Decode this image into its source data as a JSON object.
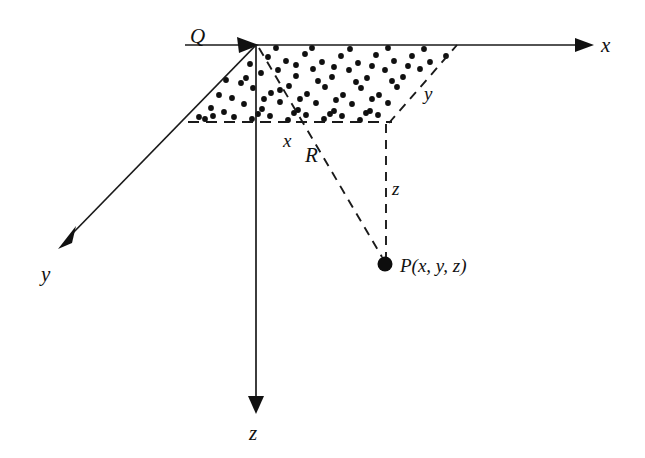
{
  "figure": {
    "background_color": "#ffffff",
    "ink_color": "#111111",
    "width": 645,
    "height": 458
  },
  "labels": {
    "origin": "Q",
    "axis_x": "x",
    "axis_y": "y",
    "axis_z": "z",
    "edge_x": "x",
    "edge_y": "y",
    "edge_z": "z",
    "radial": "R",
    "point": "P(x, y, z)"
  },
  "geometry": {
    "origin": {
      "x": 256,
      "y": 45
    },
    "point_p": {
      "x": 385,
      "y": 265
    },
    "foot_r": {
      "x": 388,
      "y": 122
    },
    "axes": [
      {
        "name": "x-axis",
        "from": [
          185,
          45
        ],
        "to": [
          590,
          45
        ],
        "arrow_at": "end"
      },
      {
        "name": "y-axis",
        "from": [
          256,
          45
        ],
        "to": [
          58,
          248
        ],
        "arrow_at": "end"
      },
      {
        "name": "z-axis",
        "from": [
          256,
          45
        ],
        "to": [
          256,
          412
        ],
        "arrow_at": "end"
      },
      {
        "name": "origin-arrow",
        "from": [
          185,
          45
        ],
        "to": [
          256,
          45
        ],
        "arrow_at": "end"
      }
    ],
    "dashed_edges": [
      {
        "name": "bottom-edge",
        "from": [
          188,
          122
        ],
        "to": [
          390,
          122
        ]
      },
      {
        "name": "right-slant-edge",
        "from": [
          388,
          122
        ],
        "to": [
          456,
          45
        ]
      },
      {
        "name": "z-drop",
        "from": [
          386,
          124
        ],
        "to": [
          386,
          258
        ]
      },
      {
        "name": "radial-R",
        "from": [
          258,
          47
        ],
        "to": [
          382,
          258
        ]
      }
    ],
    "shaded_region": {
      "name": "stippled-parallelogram",
      "vertices": [
        [
          256,
          45
        ],
        [
          456,
          45
        ],
        [
          388,
          122
        ],
        [
          188,
          122
        ]
      ]
    }
  },
  "label_positions": {
    "origin": [
      190,
      43
    ],
    "axis_x": [
      601,
      52
    ],
    "axis_y": [
      41,
      281
    ],
    "axis_z": [
      249,
      440
    ],
    "edge_x": [
      283,
      147
    ],
    "edge_y": [
      424,
      100
    ],
    "edge_z": [
      392,
      195
    ],
    "radial": [
      305,
      162
    ],
    "point": [
      400,
      272
    ]
  },
  "stipple_dots": {
    "count": 97,
    "radius": 2.9,
    "positions": [
      [
        268,
        57
      ],
      [
        286,
        61
      ],
      [
        305,
        54
      ],
      [
        322,
        62
      ],
      [
        341,
        56
      ],
      [
        358,
        63
      ],
      [
        376,
        55
      ],
      [
        394,
        61
      ],
      [
        412,
        56
      ],
      [
        430,
        62
      ],
      [
        446,
        56
      ],
      [
        261,
        73
      ],
      [
        278,
        70
      ],
      [
        296,
        76
      ],
      [
        313,
        69
      ],
      [
        332,
        77
      ],
      [
        349,
        70
      ],
      [
        367,
        78
      ],
      [
        385,
        70
      ],
      [
        403,
        77
      ],
      [
        420,
        69
      ],
      [
        437,
        76
      ],
      [
        452,
        70
      ],
      [
        253,
        88
      ],
      [
        271,
        93
      ],
      [
        289,
        86
      ],
      [
        307,
        94
      ],
      [
        325,
        87
      ],
      [
        343,
        95
      ],
      [
        361,
        88
      ],
      [
        379,
        95
      ],
      [
        397,
        87
      ],
      [
        415,
        94
      ],
      [
        432,
        87
      ],
      [
        448,
        93
      ],
      [
        244,
        104
      ],
      [
        262,
        109
      ],
      [
        280,
        102
      ],
      [
        298,
        110
      ],
      [
        316,
        103
      ],
      [
        334,
        111
      ],
      [
        352,
        104
      ],
      [
        370,
        111
      ],
      [
        388,
        103
      ],
      [
        406,
        110
      ],
      [
        423,
        104
      ],
      [
        440,
        110
      ],
      [
        234,
        117
      ],
      [
        252,
        119
      ],
      [
        270,
        116
      ],
      [
        288,
        120
      ],
      [
        306,
        115
      ],
      [
        324,
        119
      ],
      [
        342,
        116
      ],
      [
        360,
        120
      ],
      [
        378,
        115
      ],
      [
        396,
        118
      ],
      [
        414,
        116
      ],
      [
        430,
        118
      ],
      [
        276,
        48
      ],
      [
        312,
        48
      ],
      [
        350,
        49
      ],
      [
        388,
        48
      ],
      [
        424,
        49
      ],
      [
        241,
        83
      ],
      [
        232,
        98
      ],
      [
        224,
        112
      ],
      [
        213,
        116
      ],
      [
        205,
        119
      ],
      [
        250,
        64
      ],
      [
        233,
        69
      ],
      [
        226,
        80
      ],
      [
        219,
        95
      ],
      [
        211,
        108
      ],
      [
        199,
        117
      ],
      [
        246,
        78
      ],
      [
        296,
        65
      ],
      [
        334,
        67
      ],
      [
        372,
        66
      ],
      [
        408,
        66
      ],
      [
        442,
        65
      ],
      [
        264,
        99
      ],
      [
        300,
        99
      ],
      [
        336,
        100
      ],
      [
        372,
        99
      ],
      [
        408,
        100
      ],
      [
        258,
        114
      ],
      [
        294,
        113
      ],
      [
        330,
        114
      ],
      [
        366,
        113
      ],
      [
        402,
        113
      ],
      [
        418,
        111
      ],
      [
        280,
        90
      ],
      [
        318,
        81
      ],
      [
        356,
        82
      ],
      [
        392,
        81
      ],
      [
        428,
        80
      ]
    ]
  }
}
